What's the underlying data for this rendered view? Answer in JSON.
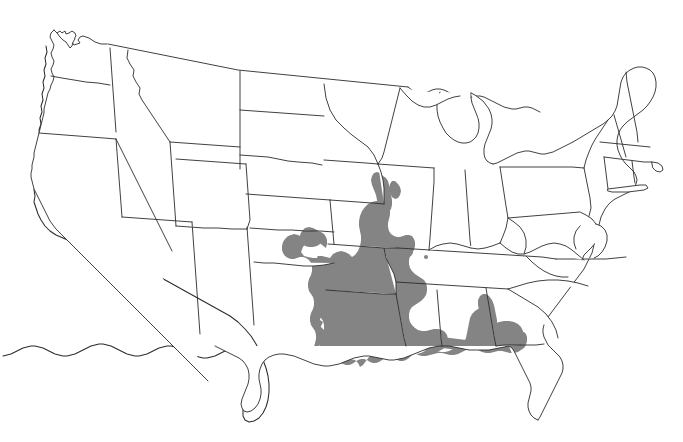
{
  "figure": {
    "type": "distribution-range-map",
    "region": "Contiguous United States",
    "title": "",
    "caption": "",
    "background_color": "#ffffff",
    "outline_color": "#2b2b2b",
    "range_fill_color": "#848484",
    "projection_note": "",
    "legend": {
      "present": false,
      "entries": [
        {
          "label": "",
          "swatch_color": "#848484"
        }
      ]
    },
    "labels": [],
    "annotations": [
      {
        "name": "isolated-occurrence-dot",
        "region": "Tennessee",
        "x": 426,
        "y": 257,
        "radius": 2.1,
        "color": "#848484"
      }
    ]
  },
  "map": {
    "shaded_regions": [
      "Eastern Texas",
      "Southeastern Oklahoma",
      "Arkansas",
      "Louisiana",
      "Mississippi",
      "Western Tennessee",
      "Southeastern Missouri",
      "Southern Illinois",
      "Western Kentucky",
      "Western Alabama",
      "Southern Alabama",
      "Florida Panhandle"
    ],
    "unshaded_note": "Remainder of the contiguous United States is unshaded.",
    "state_outlines_visible": true,
    "great_lakes_visible": true
  },
  "chart_data": {
    "type": "map",
    "title": "",
    "xlabel": "",
    "ylabel": "",
    "categories": [
      "Texas",
      "Oklahoma",
      "Arkansas",
      "Louisiana",
      "Mississippi",
      "Tennessee",
      "Missouri",
      "Illinois",
      "Kentucky",
      "Alabama",
      "Florida",
      "Georgia"
    ],
    "values": [
      1,
      1,
      1,
      1,
      1,
      1,
      1,
      1,
      1,
      1,
      1,
      0
    ],
    "value_meaning": "1 = within shaded distribution range, 0 = outside range",
    "legend_position": "none",
    "grid": false
  }
}
